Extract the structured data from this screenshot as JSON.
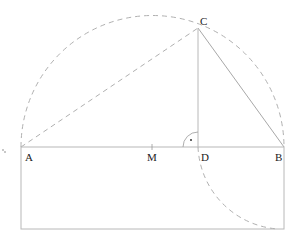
{
  "diagram": {
    "title": "",
    "points": {
      "A": {
        "label": "A",
        "x": 21,
        "y": 147
      },
      "M": {
        "label": "M",
        "x": 152,
        "y": 147
      },
      "D": {
        "label": "D",
        "x": 198,
        "y": 147
      },
      "B": {
        "label": "B",
        "x": 284,
        "y": 147
      },
      "C": {
        "label": "C",
        "x": 198,
        "y": 28
      }
    },
    "rectangle": {
      "x": 21,
      "y": 147,
      "width": 263,
      "height": 82
    },
    "right_angle_marker": {
      "at": "D",
      "symbol": "•"
    },
    "left_edge_mark": ".",
    "colors": {
      "solid_line": "#b8b8b8",
      "dashed_line": "#b0b0b0",
      "text": "#222222"
    }
  }
}
